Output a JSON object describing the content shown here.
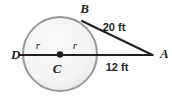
{
  "figure": {
    "background_color": "#ffffff",
    "circle": {
      "fill_color": "#f4f4f4",
      "stroke_color": "#9a9a9a",
      "center_x": 60,
      "center_y": 54,
      "radius": 37
    },
    "line_color": "#231f20",
    "center_dot_color": "#231f20",
    "points": [
      {
        "id": "B",
        "label": "B",
        "x": 84.5,
        "y": 13
      },
      {
        "id": "A",
        "label": "A",
        "x": 160,
        "y": 58
      },
      {
        "id": "D",
        "label": "D",
        "x": 11,
        "y": 59
      },
      {
        "id": "C",
        "label": "C",
        "x": 57,
        "y": 73
      }
    ],
    "radius_labels": [
      {
        "label": "r",
        "x": 38,
        "y": 49
      },
      {
        "label": "r",
        "x": 75,
        "y": 49
      }
    ],
    "measurements": [
      {
        "label": "20 ft",
        "value": 20,
        "unit": "ft",
        "x": 114,
        "y": 31,
        "segment": "BA"
      },
      {
        "label": "12 ft",
        "value": 12,
        "unit": "ft",
        "x": 117,
        "y": 71,
        "segment": "tangent-to-A"
      }
    ],
    "segments": [
      {
        "id": "DA",
        "x1": 20,
        "y1": 55,
        "x2": 152,
        "y2": 55
      },
      {
        "id": "BA",
        "x1": 82,
        "y1": 21,
        "x2": 152,
        "y2": 55
      }
    ]
  }
}
